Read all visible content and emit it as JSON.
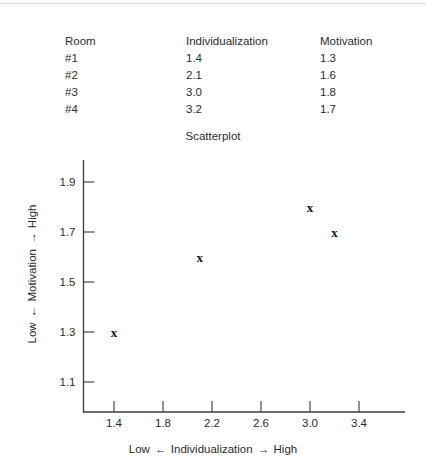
{
  "table": {
    "headers": [
      "Room",
      "Individualization",
      "Motivation"
    ],
    "rows": [
      [
        "#1",
        "1.4",
        "1.3"
      ],
      [
        "#2",
        "2.1",
        "1.6"
      ],
      [
        "#3",
        "3.0",
        "1.8"
      ],
      [
        "#4",
        "3.2",
        "1.7"
      ]
    ]
  },
  "axis_captions": {
    "x_low": "Low",
    "x_name": "Individualization",
    "x_high": "High",
    "x_arrow_left": "←",
    "x_arrow_right": "→",
    "y_low": "Low",
    "y_name": "Motivation",
    "y_high": "High",
    "y_arrow_left": "←",
    "y_arrow_right": "→"
  },
  "marker_glyph": "x",
  "chart_data": {
    "type": "scatter",
    "title": "Scatterplot",
    "xlabel": "Low ← Individualization → High",
    "ylabel": "Low ← Motivation → High",
    "xlim": [
      1.2,
      3.6
    ],
    "ylim": [
      1.0,
      2.0
    ],
    "xticks": [
      "1.4",
      "1.8",
      "2.2",
      "2.6",
      "3.0",
      "3.4"
    ],
    "xtick_values": [
      1.4,
      1.8,
      2.2,
      2.6,
      3.0,
      3.4
    ],
    "yticks": [
      "1.1",
      "1.3",
      "1.5",
      "1.7",
      "1.9"
    ],
    "ytick_values": [
      1.1,
      1.3,
      1.5,
      1.7,
      1.9
    ],
    "grid": false,
    "legend": false,
    "x": [
      1.4,
      2.1,
      3.0,
      3.2
    ],
    "y": [
      1.3,
      1.6,
      1.8,
      1.7
    ],
    "point_labels": [
      "#1",
      "#2",
      "#3",
      "#4"
    ],
    "marker": "x",
    "marker_color": "#111111"
  }
}
